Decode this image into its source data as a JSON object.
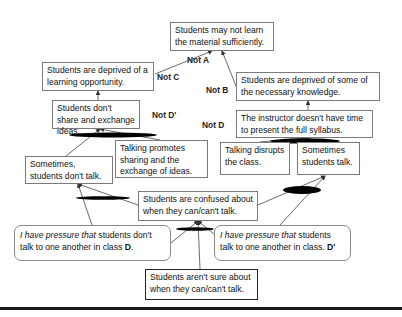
{
  "diagram": {
    "type": "evaporating-cloud / conflict-resolution tree",
    "nodes": {
      "top": "Students may not learn the material sufficiently.",
      "opportunity": "Students are deprived of a learning opportunity.",
      "knowledge": "Students are deprived of some of the necessary knowledge.",
      "dont_share": "Students don't share and exchange ideas.",
      "syllabus": "The instructor doesn't have time to present the full syllabus.",
      "promotes": "Talking promotes sharing and the exchange of ideas.",
      "dont_talk": "Sometimes, students don't talk.",
      "disrupts": "Talking disrupts the class.",
      "talk": "Sometimes students talk.",
      "confused": "Students are confused about when they can/can't talk.",
      "pressure_d_italic": "I have pressure that",
      "pressure_d_rest": " students don't talk to one another in class ",
      "pressure_d_tag": "D",
      "pressure_dp_italic": "I have pressure that",
      "pressure_dp_rest": " students talk to one another in class. ",
      "pressure_dp_tag": "D'",
      "root": "Students aren't sure about when they can/can't talk."
    },
    "labels": {
      "not_a": "Not A",
      "not_b": "Not B",
      "not_c": "Not C",
      "not_d": "Not D",
      "not_dp": "Not D'"
    }
  }
}
